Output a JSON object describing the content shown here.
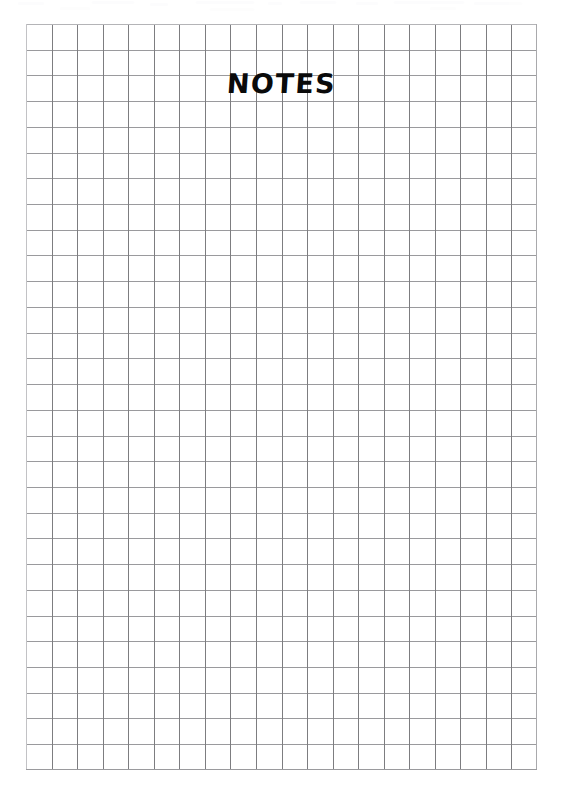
{
  "page": {
    "kind": "scanned-graph-paper-sheet",
    "background_color": "#ffffff",
    "width_px": 562,
    "height_px": 808
  },
  "title": {
    "text": "NOTES",
    "color": "#0a0a0a",
    "style": "hand-lettered-bold-marker",
    "row_index": 1
  },
  "grid": {
    "columns": 20,
    "rows": 29,
    "cell_width_px": 25.55,
    "cell_height_px": 25.72,
    "left_px": 26,
    "top_px": 24,
    "width_px": 511,
    "height_px": 746,
    "vertical_line_color": "#7d7d80",
    "horizontal_line_color": "#9a9a9d",
    "border_color": "#b4b4b7",
    "line_width_px": 1
  },
  "artifacts": {
    "label": "faint scanner smudges along top edge",
    "color": "#fbfbfc",
    "count": 12
  }
}
